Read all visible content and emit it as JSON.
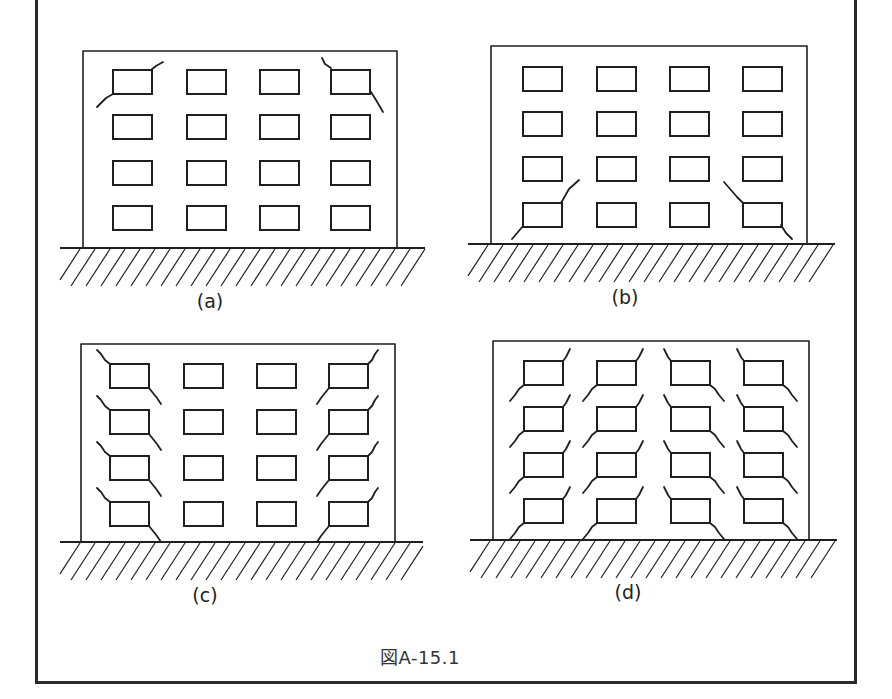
{
  "figure": {
    "caption": "図A-15.1",
    "panels": [
      {
        "id": "a",
        "label": "(a)",
        "building": {
          "x": 83,
          "y": 51,
          "w": 314,
          "h": 197
        },
        "ground": {
          "y": 248,
          "x1": 60,
          "x2": 425,
          "depth": 38
        },
        "label_pos": {
          "x": 210,
          "y": 290
        },
        "windows": {
          "cols": [
            113,
            187,
            260,
            331
          ],
          "rows": [
            70,
            115,
            161,
            206
          ],
          "w": 39,
          "h": 24
        },
        "crack_pattern": "top-corner diagonal cracks at upper outer windows",
        "cracks": [
          [
            [
              151,
              70
            ],
            [
              156,
              66
            ],
            [
              163,
              62
            ]
          ],
          [
            [
              113,
              94
            ],
            [
              106,
              98
            ],
            [
              97,
              107
            ]
          ],
          [
            [
              331,
              68
            ],
            [
              325,
              64
            ],
            [
              322,
              58
            ]
          ],
          [
            [
              371,
              92
            ],
            [
              376,
              100
            ],
            [
              383,
              112
            ]
          ]
        ]
      },
      {
        "id": "b",
        "label": "(b)",
        "building": {
          "x": 491,
          "y": 46,
          "w": 316,
          "h": 197
        },
        "ground": {
          "y": 244,
          "x1": 468,
          "x2": 835,
          "depth": 38
        },
        "label_pos": {
          "x": 625,
          "y": 287
        },
        "windows": {
          "cols": [
            523,
            597,
            670,
            743
          ],
          "rows": [
            67,
            112,
            157,
            203
          ],
          "w": 39,
          "h": 24
        },
        "crack_pattern": "bottom-corner diagonal cracks at lowest outer windows",
        "cracks": [
          [
            [
              561,
              203
            ],
            [
              565,
              196
            ],
            [
              569,
              189
            ],
            [
              579,
              180
            ]
          ],
          [
            [
              523,
              226
            ],
            [
              518,
              232
            ],
            [
              512,
              239
            ]
          ],
          [
            [
              743,
              203
            ],
            [
              737,
              197
            ],
            [
              731,
              190
            ],
            [
              724,
              182
            ]
          ],
          [
            [
              781,
              225
            ],
            [
              786,
              233
            ],
            [
              792,
              239
            ]
          ]
        ]
      },
      {
        "id": "c",
        "label": "(c)",
        "building": {
          "x": 81,
          "y": 344,
          "w": 314,
          "h": 198
        },
        "ground": {
          "y": 542,
          "x1": 60,
          "x2": 423,
          "depth": 38
        },
        "label_pos": {
          "x": 205,
          "y": 585
        },
        "windows": {
          "cols": [
            110,
            184,
            257,
            329
          ],
          "rows": [
            364,
            410,
            456,
            502
          ],
          "w": 39,
          "h": 24
        },
        "crack_pattern": "X-shaped shear cracks along outer columns at every floor",
        "cracks_left_col": true,
        "cracks_right_col": true
      },
      {
        "id": "d",
        "label": "(d)",
        "building": {
          "x": 493,
          "y": 341,
          "w": 316,
          "h": 199
        },
        "ground": {
          "y": 540,
          "x1": 470,
          "x2": 837,
          "depth": 38
        },
        "label_pos": {
          "x": 628,
          "y": 582
        },
        "windows": {
          "cols": [
            524,
            597,
            671,
            744
          ],
          "rows": [
            361,
            407,
            453,
            499
          ],
          "w": 39,
          "h": 24
        },
        "crack_pattern": "diagonal cracks at all windows forming inverted-V pattern",
        "all_cracked": true
      }
    ]
  },
  "colors": {
    "line": "#1f1f1f",
    "background": "#ffffff",
    "frame": "#2a2a2a"
  }
}
